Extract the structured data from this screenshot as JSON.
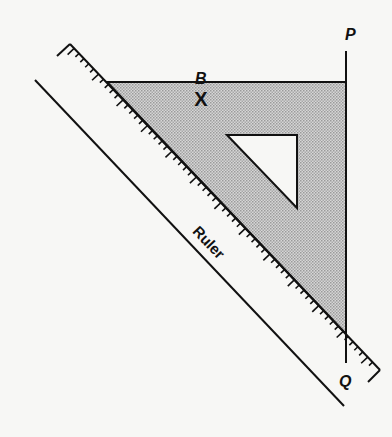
{
  "diagram": {
    "type": "geometry-construction",
    "labels": {
      "point_p": "P",
      "point_q": "Q",
      "point_b": "B",
      "mark_b": "X",
      "ruler": "Ruler"
    },
    "colors": {
      "stroke": "#111111",
      "set_square_fill": "#c4c4c4",
      "background": "#f7f7f5"
    },
    "shapes": {
      "set_square_outer": [
        [
          107,
          82
        ],
        [
          346,
          82
        ],
        [
          346,
          334
        ]
      ],
      "set_square_inner_cutout": [
        [
          227,
          135
        ],
        [
          297,
          135
        ],
        [
          297,
          208
        ]
      ],
      "line_pq": [
        [
          346,
          51
        ],
        [
          346,
          363
        ]
      ],
      "ruler_edge_upper": [
        [
          70,
          44
        ],
        [
          380,
          370
        ]
      ],
      "ruler_edge_lower": [
        [
          35,
          80
        ],
        [
          344,
          406
        ]
      ]
    }
  }
}
